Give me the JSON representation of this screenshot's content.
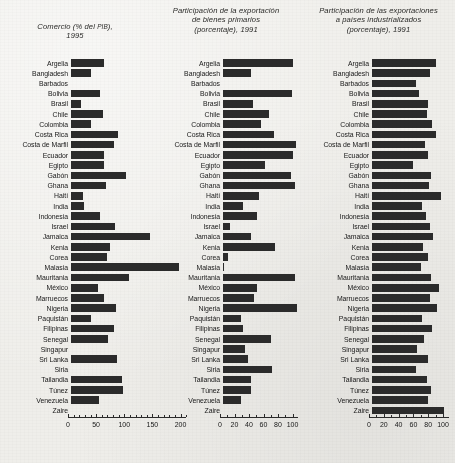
{
  "page": {
    "background_color": "#efeeea",
    "bar_color": "#2b2b2b",
    "axis_color": "#2b2b2b"
  },
  "charts": [
    {
      "title_lines": [
        "Comercio (% del PIB),",
        "1995"
      ],
      "title_small_caps": "PIB",
      "label_width_px": 68,
      "axis": {
        "min": 0,
        "max": 210,
        "ticks": [
          0,
          50,
          100,
          150,
          200
        ],
        "minor_step": 10
      },
      "pixels_per_unit": 0.5625
    },
    {
      "title_lines": [
        "Participación de la exportación",
        "de bienes primarios",
        "(porcentaje), 1991"
      ],
      "title_small_caps": "",
      "label_width_px": 70,
      "axis": {
        "min": 0,
        "max": 108,
        "ticks": [
          0,
          20,
          40,
          60,
          80,
          100
        ],
        "minor_step": 10
      },
      "pixels_per_unit": 0.725
    },
    {
      "title_lines": [
        "Participación de las exportaciones",
        "a países industrializados",
        "(porcentaje), 1991"
      ],
      "title_small_caps": "",
      "label_width_px": 67,
      "axis": {
        "min": 0,
        "max": 108,
        "ticks": [
          0,
          20,
          40,
          60,
          80,
          100
        ],
        "minor_step": 10
      },
      "pixels_per_unit": 0.74
    }
  ],
  "chart_data": [
    {
      "type": "bar",
      "orientation": "horizontal",
      "title": "Comercio (% del PIB), 1995",
      "xlabel": "",
      "ylabel": "",
      "xlim": [
        0,
        210
      ],
      "xticks": [
        0,
        50,
        100,
        150,
        200
      ],
      "grid": false,
      "legend": "none",
      "categories": [
        "Argelia",
        "Bangladesh",
        "Barbados",
        "Bolivia",
        "Brasil",
        "Chile",
        "Colombia",
        "Costa Rica",
        "Costa de Marfil",
        "Ecuador",
        "Egipto",
        "Gabón",
        "Ghana",
        "Haití",
        "India",
        "Indonesia",
        "Israel",
        "Jamaica",
        "Kenia",
        "Corea",
        "Malasia",
        "Mauritania",
        "México",
        "Marruecos",
        "Nigeria",
        "Paquistán",
        "Filipinas",
        "Senegal",
        "Singapur",
        "Sri Lanka",
        "Siria",
        "Tailandia",
        "Túnez",
        "Venezuela",
        "Zaire"
      ],
      "values": [
        59,
        36,
        0,
        52,
        17,
        57,
        35,
        83,
        77,
        58,
        58,
        97,
        62,
        22,
        23,
        52,
        79,
        140,
        69,
        64,
        192,
        103,
        48,
        59,
        80,
        35,
        77,
        66,
        0,
        81,
        0,
        90,
        93,
        49,
        0
      ]
    },
    {
      "type": "bar",
      "orientation": "horizontal",
      "title": "Participación de la exportación de bienes primarios (porcentaje), 1991",
      "xlabel": "",
      "ylabel": "",
      "xlim": [
        0,
        108
      ],
      "xticks": [
        0,
        20,
        40,
        60,
        80,
        100
      ],
      "grid": false,
      "legend": "none",
      "categories": [
        "Argelia",
        "Bangladesh",
        "Barbados",
        "Bolivia",
        "Brasil",
        "Chile",
        "Colombia",
        "Costa Rica",
        "Costa de Marfil",
        "Ecuador",
        "Egipto",
        "Gabón",
        "Ghana",
        "Haití",
        "India",
        "Indonesia",
        "Israel",
        "Jamaica",
        "Kenia",
        "Corea",
        "Malasia",
        "Mauritania",
        "México",
        "Marruecos",
        "Nigeria",
        "Paquistán",
        "Filipinas",
        "Senegal",
        "Singapur",
        "Sri Lanka",
        "Siria",
        "Tailandia",
        "Túnez",
        "Venezuela",
        "Zaire"
      ],
      "values": [
        97,
        38,
        0,
        95,
        42,
        63,
        52,
        71,
        100,
        97,
        58,
        94,
        99,
        50,
        27,
        47,
        10,
        38,
        72,
        7,
        1,
        99,
        47,
        43,
        102,
        25,
        28,
        66,
        31,
        35,
        67,
        38,
        38,
        25,
        0
      ]
    },
    {
      "type": "bar",
      "orientation": "horizontal",
      "title": "Participación de las exportaciones a países industrializados (porcentaje), 1991",
      "xlabel": "",
      "ylabel": "",
      "xlim": [
        0,
        108
      ],
      "xticks": [
        0,
        20,
        40,
        60,
        80,
        100
      ],
      "grid": false,
      "legend": "none",
      "categories": [
        "Argelia",
        "Bangladesh",
        "Barbados",
        "Bolivia",
        "Brasil",
        "Chile",
        "Colombia",
        "Costa Rica",
        "Costa de Marfil",
        "Ecuador",
        "Egipto",
        "Gabón",
        "Ghana",
        "Haití",
        "India",
        "Indonesia",
        "Israel",
        "Jamaica",
        "Kenia",
        "Corea",
        "Malasia",
        "Mauritania",
        "México",
        "Marruecos",
        "Nigeria",
        "Paquistán",
        "Filipinas",
        "Senegal",
        "Singapur",
        "Sri Lanka",
        "Siria",
        "Tailandia",
        "Túnez",
        "Venezuela",
        "Zaire"
      ],
      "values": [
        86,
        79,
        60,
        64,
        76,
        74,
        81,
        86,
        72,
        75,
        55,
        80,
        77,
        93,
        68,
        73,
        78,
        83,
        69,
        75,
        66,
        80,
        91,
        79,
        88,
        67,
        81,
        70,
        61,
        76,
        60,
        74,
        80,
        75,
        97
      ]
    }
  ]
}
